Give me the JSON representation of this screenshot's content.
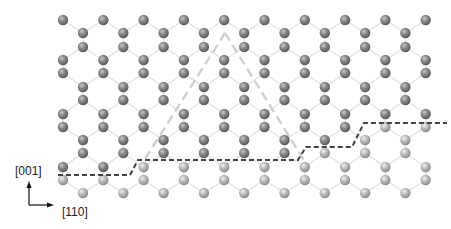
{
  "figure": {
    "type": "crystal-structure-projection",
    "axes": {
      "vertical_label": "[001]",
      "horizontal_label": "[110]"
    },
    "colors": {
      "background": "#ffffff",
      "bond": "#e2e2e2",
      "atom_upper": "#7a7a7a",
      "atom_lower": "#b4b4b4",
      "interface_line": "#444444",
      "triangle_line": "#cfcfcf",
      "arrow": "#111111"
    },
    "lattice": {
      "a_columns_x0": 63,
      "b_columns_x0": 83,
      "column_spacing": 40.3,
      "n_columns": 10,
      "a_rows_y": [
        20,
        60,
        73,
        114,
        127,
        167,
        180
      ],
      "b_rows_y": [
        33,
        47,
        87,
        100,
        140,
        153,
        193
      ]
    },
    "interface_path": [
      [
        58,
        175
      ],
      [
        130,
        175
      ],
      [
        138,
        160
      ],
      [
        298,
        160
      ],
      [
        306,
        147
      ],
      [
        352,
        147
      ],
      [
        364,
        123
      ],
      [
        447,
        123
      ]
    ],
    "triangle": {
      "apex": [
        225,
        33
      ],
      "left_base": [
        143,
        162
      ],
      "right_base": [
        305,
        162
      ]
    }
  }
}
